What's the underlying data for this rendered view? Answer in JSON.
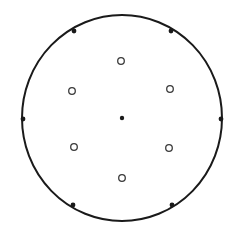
{
  "diagram": {
    "width": 243,
    "height": 225,
    "background": "#ffffff",
    "stroke_color": "#1a1a1a",
    "boundary": {
      "shape": "circle",
      "cx": 122,
      "cy": 118,
      "rx": 100,
      "ry": 103,
      "stroke_width": 2
    },
    "center_point": {
      "type": "filled",
      "cx": 122,
      "cy": 118,
      "r": 2.2
    },
    "rim_points": [
      {
        "type": "filled",
        "position": "left",
        "cx": 23,
        "cy": 119,
        "r": 2.4
      },
      {
        "type": "filled",
        "position": "right",
        "cx": 221,
        "cy": 119,
        "r": 2.4
      },
      {
        "type": "filled",
        "position": "upper-left",
        "cx": 74,
        "cy": 31,
        "r": 2.4
      },
      {
        "type": "filled",
        "position": "upper-right",
        "cx": 171,
        "cy": 31,
        "r": 2.4
      },
      {
        "type": "filled",
        "position": "lower-left",
        "cx": 73,
        "cy": 205,
        "r": 2.4
      },
      {
        "type": "filled",
        "position": "lower-right",
        "cx": 172,
        "cy": 205,
        "r": 2.4
      }
    ],
    "inner_points": [
      {
        "type": "open",
        "position": "top",
        "cx": 121,
        "cy": 61,
        "r": 3.3
      },
      {
        "type": "open",
        "position": "upper-left",
        "cx": 72,
        "cy": 91,
        "r": 3.3
      },
      {
        "type": "open",
        "position": "upper-right",
        "cx": 170,
        "cy": 89,
        "r": 3.3
      },
      {
        "type": "open",
        "position": "lower-left",
        "cx": 74,
        "cy": 147,
        "r": 3.3
      },
      {
        "type": "open",
        "position": "lower-right",
        "cx": 169,
        "cy": 148,
        "r": 3.3
      },
      {
        "type": "open",
        "position": "bottom",
        "cx": 122,
        "cy": 178,
        "r": 3.3
      }
    ]
  }
}
